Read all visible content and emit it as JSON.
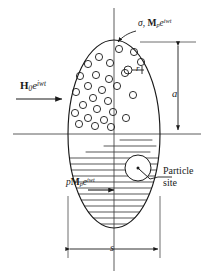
{
  "figure": {
    "labels": {
      "applied_field": {
        "symbol": "H",
        "subscript": "0",
        "exponential": "e",
        "exponent": "iwt",
        "text": "H0e^{iwt}",
        "role": "applied-oscillating-magnetic-field"
      },
      "surface_magnetization": {
        "sigma": "σ",
        "separator": ", ",
        "symbol": "M",
        "subscript": "p",
        "exponential": "e",
        "exponent": "iwt",
        "text": "σ, Mpe^{iwt}",
        "role": "surface-conductivity-and-particle-magnetization"
      },
      "internal_magnetization": {
        "prefix": "p",
        "symbol": "M",
        "subscript": "p",
        "exponential": "e",
        "exponent": "iwt",
        "text": "pMpe^{iwt}",
        "role": "volume-fraction-times-particle-magnetization"
      },
      "particle_radius": {
        "text": "r",
        "role": "particle-radius"
      },
      "semi_axis": {
        "text": "a",
        "role": "vertical-semi-axis-dimension"
      },
      "width": {
        "text": "s",
        "role": "horizontal-width-dimension"
      },
      "particle_site": {
        "line1": "Particle",
        "line2": "site",
        "role": "callout-particle-site"
      }
    },
    "geometry": {
      "ellipse": {
        "cx": 114,
        "cy": 134,
        "rx": 46,
        "ry": 94
      },
      "axis_horizontal": {
        "x1": 13,
        "x2": 201,
        "y": 134
      },
      "axis_vertical": {
        "x": 114,
        "y1": 8,
        "y2": 271
      },
      "particle_site_circle": {
        "cx": 138,
        "cy": 168,
        "r": 13
      },
      "radius_marker_circle": {
        "cx": 128,
        "cy": 70,
        "r": 4
      },
      "dimension_a": {
        "x": 178,
        "y_top": 42,
        "y_bottom": 134
      },
      "dimension_s": {
        "y": 249,
        "x_left": 68,
        "x_right": 160
      }
    },
    "colors": {
      "ink": "#1a1a1a",
      "line": "#2b2b2b",
      "hatch": "#3a3a3a",
      "background": "#ffffff"
    },
    "elements": {
      "dispersed_particles_count": 27,
      "hatch_line_count": 22,
      "upper_region": "dispersed small circles (particles)",
      "lower_region": "horizontal hatching (magnetized medium)"
    }
  }
}
